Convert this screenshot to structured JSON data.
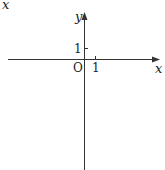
{
  "diagram": {
    "type": "coordinate-plane",
    "corner_label": "x",
    "axes": {
      "x_label": "x",
      "y_label": "y",
      "origin_label": "O",
      "x_tick_label": "1",
      "y_tick_label": "1"
    },
    "colors": {
      "axis": "#333333",
      "text": "#222222",
      "background": "#ffffff"
    }
  }
}
